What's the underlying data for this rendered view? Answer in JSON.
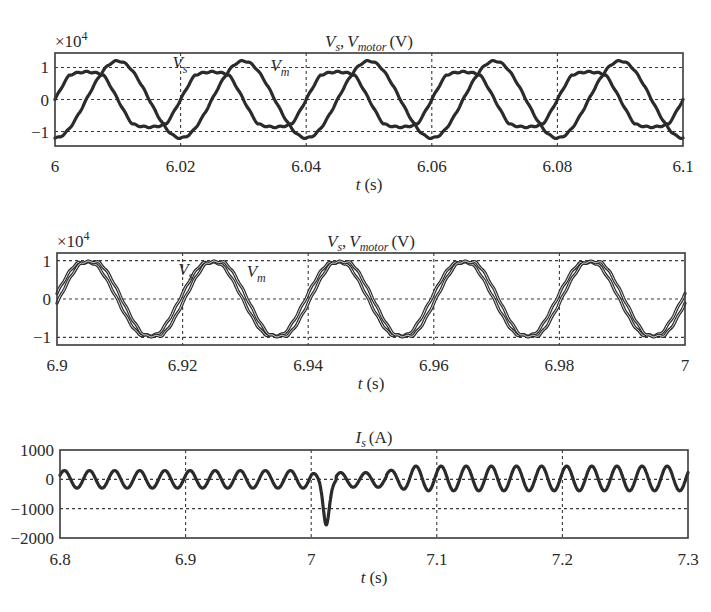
{
  "chart_data": [
    {
      "type": "line",
      "id": "plot1",
      "title": "Vs, Vmotor (V)",
      "title_parts": {
        "v1": "V",
        "s1": "s",
        "sep": ",",
        "v2": "V",
        "s2": "motor",
        "unit": "(V)"
      },
      "xlabel": "t (s)",
      "xlabel_parts": {
        "var": "t",
        "unit": "(s)"
      },
      "ylabel": "",
      "y_multiplier": "×10",
      "y_multiplier_exp": "4",
      "xlim": [
        6.0,
        6.1
      ],
      "ylim": [
        -1.45,
        1.45
      ],
      "xticks": [
        6.0,
        6.02,
        6.04,
        6.06,
        6.08,
        6.1
      ],
      "xtick_labels": [
        "6",
        "6.02",
        "6.04",
        "6.06",
        "6.08",
        "6.1"
      ],
      "yticks": [
        -1,
        0,
        1
      ],
      "ytick_labels": [
        "−1",
        "0",
        "1"
      ],
      "grid": true,
      "frequency_hz": 50,
      "annotations": [
        {
          "text": "V",
          "sub": "s",
          "x": 6.0187,
          "y": 0.98
        },
        {
          "text": "V",
          "sub": "m",
          "x": 6.0343,
          "y": 0.88
        }
      ],
      "series": [
        {
          "name": "Vs",
          "amplitude": 0.86,
          "phase_deg": 0,
          "offset": 0,
          "flatness": 0.35,
          "x": [
            6.0,
            6.0025,
            6.005,
            6.0075,
            6.01,
            6.0125,
            6.015,
            6.0175,
            6.02,
            6.0225,
            6.025,
            6.0275,
            6.03,
            6.0325,
            6.035,
            6.0375,
            6.04
          ],
          "values": [
            0.0,
            0.64,
            0.86,
            0.64,
            0.0,
            -0.64,
            -0.86,
            -0.64,
            0.0,
            0.64,
            0.86,
            0.64,
            0.0,
            -0.64,
            -0.86,
            -0.64,
            0.0
          ]
        },
        {
          "name": "Vm",
          "amplitude": 1.2,
          "phase_deg": -90,
          "offset": 0,
          "flatness": 0.0,
          "x": [
            6.0,
            6.0025,
            6.005,
            6.0075,
            6.01,
            6.0125,
            6.015,
            6.0175,
            6.02,
            6.0225,
            6.025,
            6.0275,
            6.03,
            6.0325,
            6.035,
            6.0375,
            6.04
          ],
          "values": [
            -1.2,
            -0.85,
            0.0,
            0.85,
            1.2,
            0.85,
            0.0,
            -0.85,
            -1.2,
            -0.85,
            0.0,
            0.85,
            1.2,
            0.85,
            0.0,
            -0.85,
            -1.2
          ]
        }
      ]
    },
    {
      "type": "line",
      "id": "plot2",
      "title": "Vs, Vmotor (V)",
      "title_parts": {
        "v1": "V",
        "s1": "s",
        "sep": ",",
        "v2": "V",
        "s2": "motor",
        "unit": "(V)"
      },
      "xlabel": "t (s)",
      "xlabel_parts": {
        "var": "t",
        "unit": "(s)"
      },
      "ylabel": "",
      "y_multiplier": "×10",
      "y_multiplier_exp": "4",
      "xlim": [
        6.9,
        7.0
      ],
      "ylim": [
        -1.2,
        1.2
      ],
      "xticks": [
        6.9,
        6.92,
        6.94,
        6.96,
        6.98,
        7.0
      ],
      "xtick_labels": [
        "6.9",
        "6.92",
        "6.94",
        "6.96",
        "6.98",
        "7"
      ],
      "yticks": [
        -1,
        0,
        1
      ],
      "ytick_labels": [
        "−1",
        "0",
        "1"
      ],
      "grid": true,
      "frequency_hz": 50,
      "annotations": [
        {
          "text": "V",
          "sub": "s",
          "x": 6.9193,
          "y": 0.62
        },
        {
          "text": "V",
          "sub": "m",
          "x": 6.9302,
          "y": 0.58
        }
      ],
      "series": [
        {
          "name": "Vs",
          "amplitude": 0.95,
          "phase_deg": 8,
          "offset": 0,
          "flatness": 0.1,
          "x": [
            6.9,
            6.905,
            6.91,
            6.915,
            6.92,
            6.925,
            6.93,
            6.935,
            6.94,
            6.945,
            6.95,
            6.955,
            6.96,
            6.965,
            6.97,
            6.975,
            6.98,
            6.985,
            6.99,
            6.995,
            7.0
          ],
          "values": [
            0.13,
            0.94,
            -0.13,
            -0.94,
            0.13,
            0.94,
            -0.13,
            -0.94,
            0.13,
            0.94,
            -0.13,
            -0.94,
            0.13,
            0.94,
            -0.13,
            -0.94,
            0.13,
            0.94,
            -0.13,
            -0.94,
            0.13
          ]
        },
        {
          "name": "Vm",
          "amplitude": 0.97,
          "phase_deg": -6,
          "offset": 0,
          "flatness": 0.1,
          "x": [
            6.9,
            6.905,
            6.91,
            6.915,
            6.92,
            6.925,
            6.93,
            6.935,
            6.94,
            6.945,
            6.95,
            6.955,
            6.96,
            6.965,
            6.97,
            6.975,
            6.98,
            6.985,
            6.99,
            6.995,
            7.0
          ],
          "values": [
            -0.1,
            0.96,
            0.1,
            -0.96,
            -0.1,
            0.96,
            0.1,
            -0.96,
            -0.1,
            0.96,
            0.1,
            -0.96,
            -0.1,
            0.96,
            0.1,
            -0.96,
            -0.1,
            0.96,
            0.1,
            -0.96,
            -0.1
          ]
        }
      ]
    },
    {
      "type": "line",
      "id": "plot3",
      "title": "Is (A)",
      "title_parts": {
        "v1": "I",
        "s1": "s",
        "unit": "(A)"
      },
      "xlabel": "t (s)",
      "xlabel_parts": {
        "var": "t",
        "unit": "(s)"
      },
      "ylabel": "",
      "xlim": [
        6.8,
        7.3
      ],
      "ylim": [
        -2000,
        1000
      ],
      "xticks": [
        6.8,
        6.9,
        7.0,
        7.1,
        7.2,
        7.3
      ],
      "xtick_labels": [
        "6.8",
        "6.9",
        "7",
        "7.1",
        "7.2",
        "7.3"
      ],
      "yticks": [
        -2000,
        -1000,
        0,
        1000
      ],
      "ytick_labels": [
        "−2000",
        "−1000",
        "0",
        "1000"
      ],
      "grid": true,
      "frequency_hz": 50,
      "series": [
        {
          "name": "Is",
          "segments": [
            {
              "t0": 6.8,
              "t1": 7.0,
              "amplitude": 300,
              "offset": 0
            },
            {
              "t0": 7.0,
              "t1": 7.02,
              "dip_min": -1550,
              "dip_time": 7.012
            },
            {
              "t0": 7.02,
              "t1": 7.06,
              "amplitude": 250,
              "offset": -20
            },
            {
              "t0": 7.06,
              "t1": 7.3,
              "amplitude": 420,
              "offset": 30
            }
          ],
          "x": [
            6.8,
            6.805,
            6.815,
            6.825,
            6.835,
            6.9,
            6.905,
            6.915,
            7.0,
            7.005,
            7.012,
            7.018,
            7.025,
            7.035,
            7.045,
            7.055,
            7.065,
            7.075,
            7.105,
            7.115,
            7.2,
            7.205,
            7.215,
            7.3
          ],
          "values": [
            0,
            300,
            -300,
            300,
            -300,
            0,
            300,
            -300,
            300,
            -200,
            -1550,
            -300,
            230,
            -270,
            230,
            -270,
            450,
            -390,
            450,
            -390,
            30,
            450,
            -390,
            30
          ]
        }
      ]
    }
  ]
}
